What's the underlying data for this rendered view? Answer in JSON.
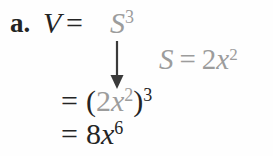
{
  "colors": {
    "ink": "#242424",
    "faded_gray": "#9c9c9c",
    "arrow": "#3a3a3a",
    "background": "#fefefe"
  },
  "icons": {
    "substitution_arrow": "down-arrow"
  },
  "solution": {
    "item_label": "a.",
    "step1": {
      "lhs": "V",
      "equals": "=",
      "base": "S",
      "exponent": "3"
    },
    "substitution_note": {
      "lhs": "S",
      "equals": "=",
      "coefficient": "2",
      "variable": "x",
      "exponent": "2"
    },
    "step2": {
      "equals": "=",
      "open_paren": "(",
      "coefficient": "2",
      "variable": "x",
      "inner_exponent": "2",
      "close_paren": ")",
      "outer_exponent": "3"
    },
    "step3": {
      "equals": "=",
      "coefficient": "8",
      "variable": "x",
      "exponent": "6"
    }
  }
}
